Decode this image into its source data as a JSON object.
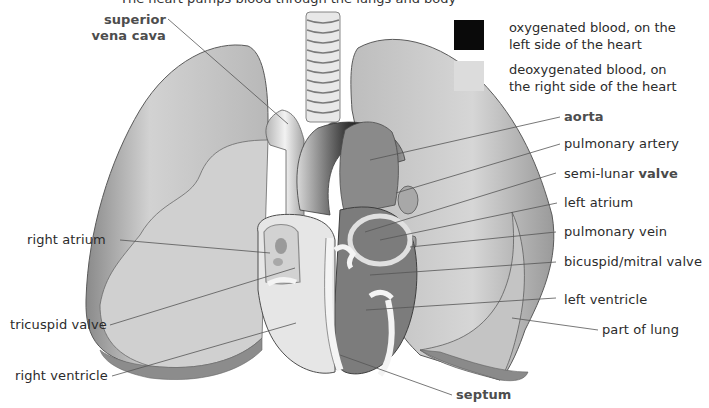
{
  "title_cut": "The heart pumps blood through the lungs and body",
  "legend": {
    "items": [
      {
        "swatch_color": "#0a0a0a",
        "line1": "oxygenated blood, on the",
        "line2": "left side of the heart"
      },
      {
        "swatch_color": "#dcdcdc",
        "line1": "deoxygenated blood, on",
        "line2": "the right side of the heart"
      }
    ]
  },
  "labels": {
    "superior_vena_cava": {
      "line1": "superior",
      "line2": "vena cava"
    },
    "aorta": "aorta",
    "pulmonary_artery": "pulmonary artery",
    "semi_lunar_valve": {
      "prefix": "semi-lunar ",
      "bold": "valve"
    },
    "left_atrium": "left atrium",
    "pulmonary_vein": "pulmonary vein",
    "bicuspid_mitral_valve": "bicuspid/mitral valve",
    "left_ventricle": "left ventricle",
    "part_of_lung": "part of lung",
    "right_atrium": "right atrium",
    "tricuspid_valve": "tricuspid valve",
    "right_ventricle": "right ventricle",
    "septum": "septum"
  },
  "colors": {
    "oxygenated": "#6e6e6e",
    "deoxygenated": "#e4e4e4",
    "lung": "#c8c8c8",
    "lung_dark": "#8e8e8e",
    "leader_line": "#555555"
  }
}
